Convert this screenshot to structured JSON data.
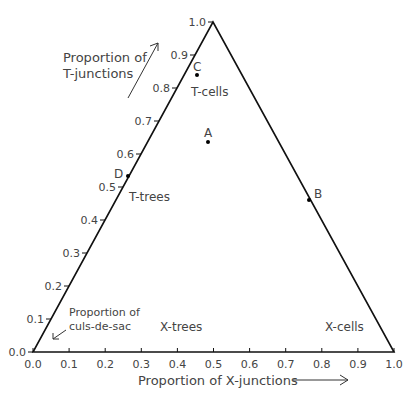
{
  "chart_data": {
    "type": "scatter",
    "title": "",
    "subtype": "ternary-triangle",
    "xlabel": "Proportion of X-junctions",
    "ylabel": "Proportion of T-junctions",
    "corner_label": "Proportion of culs-de-sac",
    "xlim": [
      0.0,
      1.0
    ],
    "ylim": [
      0.0,
      1.0
    ],
    "x_ticks": [
      "0.0",
      "0.1",
      "0.2",
      "0.3",
      "0.4",
      "0.5",
      "0.6",
      "0.7",
      "0.8",
      "0.9",
      "1.0"
    ],
    "y_ticks": [
      "0.0",
      "0.1",
      "0.2",
      "0.3",
      "0.4",
      "0.5",
      "0.6",
      "0.7",
      "0.8",
      "0.9",
      "1.0"
    ],
    "regions": [
      "T-cells",
      "T-trees",
      "X-trees",
      "X-cells"
    ],
    "points": [
      {
        "label": "A",
        "x": 0.49,
        "y": 0.63
      },
      {
        "label": "B",
        "x": 0.77,
        "y": 0.46
      },
      {
        "label": "C",
        "x": 0.46,
        "y": 0.84
      },
      {
        "label": "D",
        "x": 0.27,
        "y": 0.53
      }
    ]
  },
  "labels": {
    "y_axis_line1": "Proportion of",
    "y_axis_line2": "T-junctions",
    "corner_line1": "Proportion of",
    "corner_line2": "culs-de-sac",
    "x_axis": "Proportion of X-junctions",
    "region_tcells": "T-cells",
    "region_ttrees": "T-trees",
    "region_xtrees": "X-trees",
    "region_xcells": "X-cells",
    "point_a": "A",
    "point_b": "B",
    "point_c": "C",
    "point_d": "D"
  }
}
